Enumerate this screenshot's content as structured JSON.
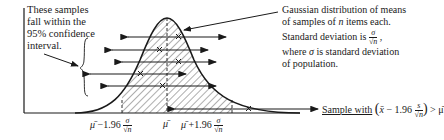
{
  "left_note": {
    "lines": [
      "These samples",
      "fall within the",
      "95% confidence",
      "interval."
    ]
  },
  "right_note": {
    "line1": "Gaussian distribution of means",
    "line2_pre": "of samples of ",
    "line2_var": "n",
    "line2_post": " items each.",
    "line3_pre": "Standard deviation is ",
    "line3_frac_num": "σ",
    "line3_frac_den": "√n",
    "line3_post": " ,",
    "line4_pre": "where ",
    "line4_var": "σ",
    "line4_post": " is standard deviation",
    "line5": "of population."
  },
  "sample_label": {
    "text": "Sample with",
    "expr_open": "(",
    "expr_xbar": "x̄",
    "expr_mid": " − 1.96 ",
    "expr_frac_num": "s",
    "expr_frac_den": "√n",
    "expr_close": ")",
    "expr_tail": " > μ̄"
  },
  "axis_labels": {
    "lower": {
      "mu": "μ̄",
      "op": " −1.96 ",
      "num": "σ",
      "den": "√n"
    },
    "center": "μ̄",
    "upper": {
      "mu": "μ̄",
      "op": " +1.96 ",
      "num": "σ",
      "den": "√n"
    }
  },
  "colors": {
    "ink": "#1a1a1a",
    "background": "#ffffff",
    "hatch": "#333333"
  }
}
